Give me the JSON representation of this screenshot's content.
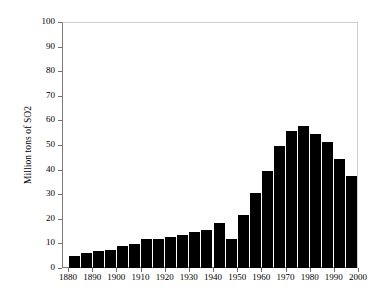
{
  "chart_data": {
    "type": "bar",
    "title": "",
    "xlabel": "",
    "ylabel": "Million tons of SO2",
    "ylim": [
      0,
      100
    ],
    "xlim": [
      1877.5,
      2000
    ],
    "grid": false,
    "legend": null,
    "bar_color": "#000000",
    "frame_color": "#7a7a7a",
    "y_ticks": [
      0,
      10,
      20,
      30,
      40,
      50,
      60,
      70,
      80,
      90,
      100
    ],
    "y_tick_labels": [
      "0",
      "10",
      "20",
      "30",
      "40",
      "50",
      "60",
      "70",
      "80",
      "90",
      "100"
    ],
    "x_ticks": [
      1880,
      1890,
      1900,
      1910,
      1920,
      1930,
      1940,
      1950,
      1960,
      1970,
      1980,
      1990,
      2000
    ],
    "x_tick_labels": [
      "1880",
      "1890",
      "1900",
      "1910",
      "1920",
      "1930",
      "1940",
      "1950",
      "1960",
      "1970",
      "1980",
      "1990",
      "2000"
    ],
    "categories": [
      1880,
      1885,
      1890,
      1895,
      1900,
      1905,
      1910,
      1915,
      1920,
      1925,
      1930,
      1935,
      1940,
      1945,
      1950,
      1955,
      1960,
      1965,
      1970,
      1975,
      1980,
      1985,
      1990,
      1995
    ],
    "values": [
      4.9,
      6.0,
      7.0,
      7.3,
      8.8,
      9.8,
      11.7,
      11.7,
      12.6,
      13.6,
      14.6,
      15.6,
      18.5,
      11.6,
      21.6,
      30.6,
      39.5,
      49.4,
      55.5,
      57.6,
      54.4,
      51.4,
      44.4,
      37.4
    ]
  }
}
